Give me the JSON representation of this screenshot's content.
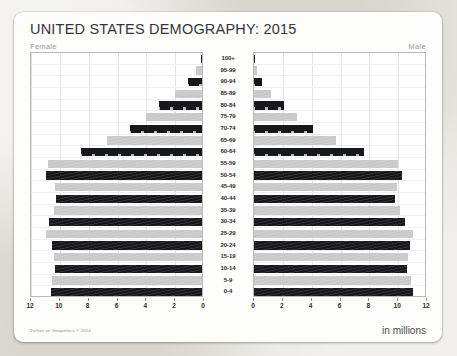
{
  "card": {
    "title": "UNITED STATES DEMOGRAPHY: 2015",
    "female_label": "Female",
    "male_label": "Male",
    "units_label": "in millions",
    "credit": "Zeihan on Geopolitics © 2014"
  },
  "chart_data": {
    "type": "bar",
    "subtype": "population-pyramid",
    "title": "UNITED STATES DEMOGRAPHY: 2015",
    "xlabel": "in millions",
    "ylabel": "Age group",
    "xlim": [
      0,
      12
    ],
    "xticks": [
      0,
      2,
      4,
      6,
      8,
      10,
      12
    ],
    "left_xticks": [
      12,
      10,
      8,
      6,
      4,
      2,
      0
    ],
    "right_xticks": [
      0,
      2,
      4,
      6,
      8,
      10,
      12
    ],
    "grid": true,
    "legend": [
      "Female",
      "Male"
    ],
    "legend_position": "top-corners",
    "categories": [
      "100+",
      "95-99",
      "90-94",
      "85-89",
      "80-84",
      "75-79",
      "70-74",
      "65-69",
      "60-64",
      "55-59",
      "50-54",
      "45-49",
      "40-44",
      "35-39",
      "30-34",
      "25-29",
      "20-24",
      "15-19",
      "10-14",
      "5-9",
      "0-4"
    ],
    "series": [
      {
        "name": "Female",
        "side": "left",
        "values": [
          0.08,
          0.45,
          1.0,
          1.9,
          3.0,
          3.9,
          5.0,
          6.6,
          8.4,
          10.7,
          10.8,
          10.2,
          10.1,
          10.3,
          10.6,
          10.8,
          10.4,
          10.3,
          10.2,
          10.4,
          10.5
        ]
      },
      {
        "name": "Male",
        "side": "right",
        "values": [
          0.03,
          0.2,
          0.55,
          1.2,
          2.1,
          3.0,
          4.1,
          5.7,
          7.6,
          10.0,
          10.3,
          9.9,
          9.8,
          10.1,
          10.5,
          11.0,
          10.8,
          10.7,
          10.6,
          10.9,
          11.0
        ]
      }
    ],
    "bar_style": {
      "pattern": "alternating-flag-stripes",
      "dark_color": "#17181c",
      "light_color": "#c9c9c9",
      "stars_rows": [
        "95-99",
        "90-94",
        "85-89",
        "80-84",
        "75-79",
        "70-74",
        "65-69",
        "60-64"
      ]
    }
  }
}
